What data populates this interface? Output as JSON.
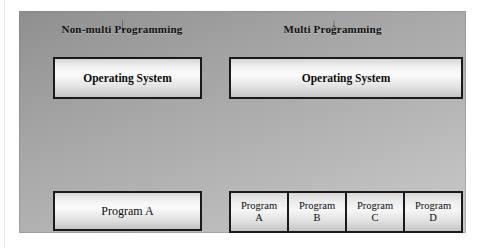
{
  "diagram": {
    "columns": [
      {
        "id": "non-multi",
        "title": "Non-multi Programming",
        "os_box": "Operating System",
        "program_box": "Program A",
        "connector": "single-down-arrow"
      },
      {
        "id": "multi",
        "title": "Multi Programming",
        "os_box": "Operating System",
        "connector": "dash-dot-fan-up-arrow",
        "programs": [
          {
            "line1": "Program",
            "line2": "A"
          },
          {
            "line1": "Program",
            "line2": "B"
          },
          {
            "line1": "Program",
            "line2": "C"
          },
          {
            "line1": "Program",
            "line2": "D"
          }
        ]
      }
    ],
    "colors": {
      "frame_background_light": "#c9c9c9",
      "frame_background_dark": "#8f8f8f",
      "box_border": "#1a1a1a",
      "box_fill_highlight": "#fbfbfb",
      "text": "#0d0d0d",
      "connector": "#000000"
    }
  }
}
